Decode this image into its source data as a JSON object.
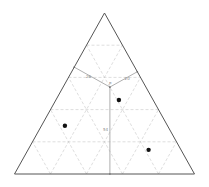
{
  "diagram": {
    "title": "",
    "type": "ternary-diagram",
    "vertices": {
      "top": "",
      "bottom_left": "",
      "bottom_right": ""
    },
    "grid_divisions": 5,
    "interior_point": {
      "label": "P",
      "fractions": {
        "left_edge": 0.26,
        "right_edge": 0.2,
        "bottom_edge": 0.54
      }
    },
    "distance_labels": {
      "left": "26",
      "right": "20",
      "bottom": "54"
    },
    "points": [
      {
        "name": "point-1",
        "fractions": {
          "a": 0.46,
          "b": 0.19,
          "c": 0.35
        }
      },
      {
        "name": "point-2",
        "fractions": {
          "a": 0.3,
          "b": 0.57,
          "c": 0.13
        }
      },
      {
        "name": "point-3",
        "fractions": {
          "a": 0.15,
          "b": 0.18,
          "c": 0.67
        }
      }
    ]
  }
}
